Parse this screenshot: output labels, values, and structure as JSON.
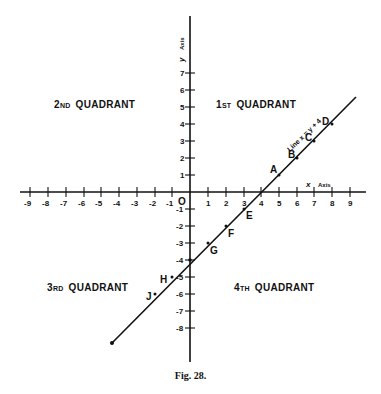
{
  "figure": {
    "caption": "Fig. 28.",
    "origin_label": "O",
    "x_axis_label": {
      "var": "x",
      "word": "Axis"
    },
    "y_axis_label": {
      "var": "y",
      "word": "Axis"
    },
    "line_label": "Line x = y + 4",
    "quadrants": [
      {
        "id": "q1",
        "num": "1",
        "suffix": "ST",
        "word": "QUADRANT"
      },
      {
        "id": "q2",
        "num": "2",
        "suffix": "ND",
        "word": "QUADRANT"
      },
      {
        "id": "q3",
        "num": "3",
        "suffix": "RD",
        "word": "QUADRANT"
      },
      {
        "id": "q4",
        "num": "4",
        "suffix": "TH",
        "word": "QUADRANT"
      }
    ],
    "x_ticks": [
      "-9",
      "-8",
      "-7",
      "-6",
      "-5",
      "-4",
      "-3",
      "-2",
      "-1",
      "1",
      "2",
      "3",
      "4",
      "5",
      "6",
      "7",
      "8",
      "9"
    ],
    "y_ticks": [
      "7",
      "6",
      "5",
      "4",
      "3",
      "2",
      "1",
      "-1",
      "-2",
      "-3",
      "-4",
      "-5",
      "-6",
      "-7",
      "-8"
    ],
    "points": [
      {
        "label": "A",
        "x": 5,
        "y": 1
      },
      {
        "label": "B",
        "x": 6,
        "y": 2
      },
      {
        "label": "C",
        "x": 7,
        "y": 3
      },
      {
        "label": "D",
        "x": 8,
        "y": 4
      },
      {
        "label": "E",
        "x": 3,
        "y": -1
      },
      {
        "label": "F",
        "x": 2,
        "y": -2
      },
      {
        "label": "G",
        "x": 1,
        "y": -3
      },
      {
        "label": "H",
        "x": -1,
        "y": -5
      },
      {
        "label": "J",
        "x": -2,
        "y": -6
      }
    ],
    "colors": {
      "ink": "#111111",
      "paper": "#ffffff"
    }
  }
}
